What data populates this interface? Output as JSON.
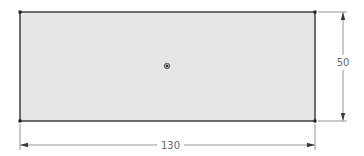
{
  "sketch": {
    "shape": "rectangle",
    "fill_color": "#e6e6e6",
    "edge_color": "#4a4a4a",
    "dimension_color": "#6a6a6a",
    "center_point": "origin-point",
    "dimensions": {
      "width": {
        "label": "130",
        "orientation": "horizontal"
      },
      "height": {
        "label": "50",
        "orientation": "vertical"
      }
    }
  }
}
